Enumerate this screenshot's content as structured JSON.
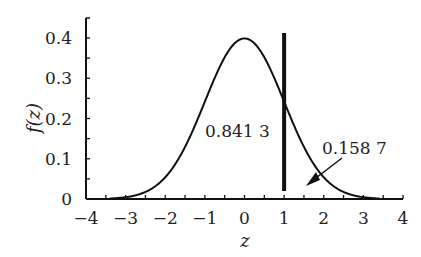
{
  "chart_data": {
    "type": "line",
    "title": "",
    "xlabel": "z",
    "ylabel": "f(z)",
    "xlim": [
      -4,
      4
    ],
    "ylim": [
      0,
      0.42
    ],
    "x_ticks": [
      "−4",
      "−3",
      "−2",
      "−1",
      "0",
      "1",
      "2",
      "3",
      "4"
    ],
    "y_ticks": [
      "0",
      "0.1",
      "0.2",
      "0.3",
      "0.4"
    ],
    "series": [
      {
        "name": "standard normal density",
        "function": "f(z) = exp(-z^2/2)/sqrt(2*pi)"
      }
    ],
    "vertical_line": {
      "x": 1
    },
    "annotations": [
      {
        "text": "0.841 3",
        "meaning": "area left of z=1"
      },
      {
        "text": "0.158 7",
        "meaning": "area right of z=1",
        "arrow": true
      }
    ],
    "grid": false,
    "legend": "none"
  }
}
